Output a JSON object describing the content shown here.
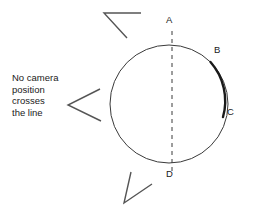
{
  "figure": {
    "background_color": "#ffffff",
    "stroke_color": "#333333",
    "text_color": "#1a1a1a",
    "annotation": {
      "text": "No camera\nposition\ncrosses\nthe line"
    },
    "point_labels": [
      {
        "id": "A",
        "label": "A",
        "x": 169,
        "y": 20,
        "position": "top"
      },
      {
        "id": "B",
        "label": "B",
        "x": 216,
        "y": 50,
        "position": "upper-right"
      },
      {
        "id": "C",
        "label": "C",
        "x": 229,
        "y": 112,
        "position": "right"
      },
      {
        "id": "D",
        "label": "D",
        "x": 169,
        "y": 174,
        "position": "bottom"
      }
    ],
    "circle": {
      "cx": 169,
      "cy": 104,
      "r": 59,
      "stroke_width": 1
    },
    "dashed_line": {
      "x": 172,
      "y1": 32,
      "y2": 170,
      "dash": "4 4"
    },
    "bold_arc": {
      "from_label": "B",
      "to_label": "C",
      "stroke_width": 2.2
    },
    "arrows": [
      {
        "name": "top-left-caret",
        "vertex_x": 105,
        "vertex_y": 14
      },
      {
        "name": "middle-left-caret",
        "vertex_x": 68,
        "vertex_y": 105
      },
      {
        "name": "bottom-caret",
        "vertex_x": 124,
        "vertex_y": 203
      }
    ]
  }
}
